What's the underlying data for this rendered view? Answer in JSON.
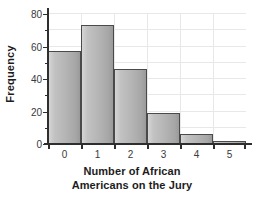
{
  "chart_data": {
    "type": "bar",
    "title": "",
    "xlabel": "Number of African Americans on the Jury",
    "xlabel_line1": "Number of African",
    "xlabel_line2": "Americans on the Jury",
    "ylabel": "Frequency",
    "categories": [
      "0",
      "1",
      "2",
      "3",
      "4",
      "5"
    ],
    "values": [
      57,
      73,
      46,
      19,
      6,
      2
    ],
    "ylim": [
      0,
      80
    ],
    "xlim": [
      -0.5,
      5.5
    ],
    "ytick_labels": [
      "0",
      "20",
      "40",
      "60",
      "80"
    ],
    "ytick_values": [
      0,
      20,
      40,
      60,
      80
    ],
    "yminor_values": [
      10,
      30,
      50,
      70
    ],
    "gridlines": [
      10,
      20,
      30,
      40,
      50,
      60,
      70,
      80
    ],
    "vertical_gridlines": [
      0.5,
      1.5,
      2.5,
      3.5,
      4.5
    ],
    "grid": true,
    "legend": "none",
    "bar_fill_light": "#d5d5d5",
    "bar_fill_dark": "#9a9a9a",
    "bar_edge_color": "#4a4a4a",
    "grid_color": "#e8e8e8",
    "axis_color": "#2e2e2e",
    "background": "#ffffff"
  }
}
